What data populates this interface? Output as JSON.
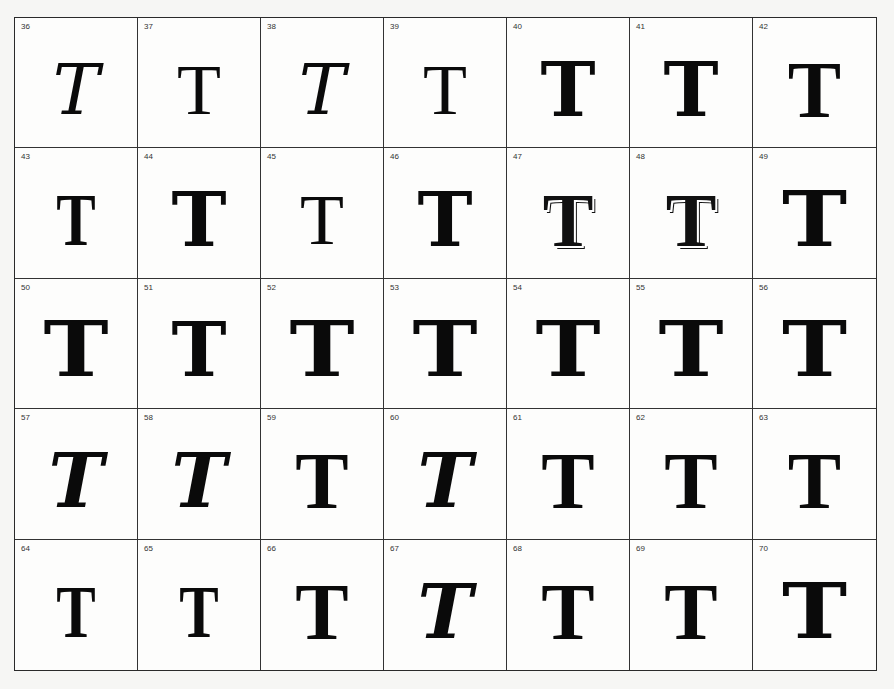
{
  "specimen": {
    "title": "Decorative letter T specimens",
    "letter": "T",
    "rows": 5,
    "columns": 7,
    "cells": [
      {
        "number": "36",
        "glyph": "T",
        "style": "g-script"
      },
      {
        "number": "37",
        "glyph": "T",
        "style": "g-ornament"
      },
      {
        "number": "38",
        "glyph": "T",
        "style": "g-script"
      },
      {
        "number": "39",
        "glyph": "T",
        "style": "g-ornament"
      },
      {
        "number": "40",
        "glyph": "T",
        "style": "g-bold"
      },
      {
        "number": "41",
        "glyph": "T",
        "style": "g-bold"
      },
      {
        "number": "42",
        "glyph": "T",
        "style": "g-gothic"
      },
      {
        "number": "43",
        "glyph": "T",
        "style": "g-narrow"
      },
      {
        "number": "44",
        "glyph": "T",
        "style": "g-bold"
      },
      {
        "number": "45",
        "glyph": "T",
        "style": "g-ornament"
      },
      {
        "number": "46",
        "glyph": "T",
        "style": "g-bold"
      },
      {
        "number": "47",
        "glyph": "T",
        "style": "g-outline"
      },
      {
        "number": "48",
        "glyph": "T",
        "style": "g-outline"
      },
      {
        "number": "49",
        "glyph": "T",
        "style": "g-black"
      },
      {
        "number": "50",
        "glyph": "T",
        "style": "g-black"
      },
      {
        "number": "51",
        "glyph": "T",
        "style": "g-bold"
      },
      {
        "number": "52",
        "glyph": "T",
        "style": "g-black"
      },
      {
        "number": "53",
        "glyph": "T",
        "style": "g-black"
      },
      {
        "number": "54",
        "glyph": "T",
        "style": "g-black"
      },
      {
        "number": "55",
        "glyph": "T",
        "style": "g-black"
      },
      {
        "number": "56",
        "glyph": "T",
        "style": "g-black"
      },
      {
        "number": "57",
        "glyph": "T",
        "style": "g-italic-bold"
      },
      {
        "number": "58",
        "glyph": "T",
        "style": "g-italic-bold"
      },
      {
        "number": "59",
        "glyph": "T",
        "style": "g-gothic"
      },
      {
        "number": "60",
        "glyph": "T",
        "style": "g-italic-bold"
      },
      {
        "number": "61",
        "glyph": "T",
        "style": "g-gothic"
      },
      {
        "number": "62",
        "glyph": "T",
        "style": "g-gothic"
      },
      {
        "number": "63",
        "glyph": "T",
        "style": "g-gothic"
      },
      {
        "number": "64",
        "glyph": "T",
        "style": "g-narrow"
      },
      {
        "number": "65",
        "glyph": "T",
        "style": "g-narrow"
      },
      {
        "number": "66",
        "glyph": "T",
        "style": "g-gothic"
      },
      {
        "number": "67",
        "glyph": "T",
        "style": "g-italic-bold"
      },
      {
        "number": "68",
        "glyph": "T",
        "style": "g-gothic"
      },
      {
        "number": "69",
        "glyph": "T",
        "style": "g-gothic"
      },
      {
        "number": "70",
        "glyph": "T",
        "style": "g-black"
      }
    ]
  }
}
